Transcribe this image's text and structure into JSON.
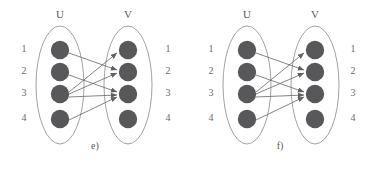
{
  "figure": {
    "background": "#ffffff",
    "node_color": "#58585a",
    "outline_color": "#8e8f91",
    "edge_color": "#6d6e70",
    "text_color": "#58595b",
    "width": 373,
    "height": 171
  },
  "panels": [
    {
      "id": "e",
      "caption": "e)",
      "left_set": {
        "title": "U",
        "nodes": [
          {
            "label": "1",
            "cx": 60,
            "cy": 50
          },
          {
            "label": "2",
            "cx": 60,
            "cy": 72
          },
          {
            "label": "3",
            "cx": 60,
            "cy": 94
          },
          {
            "label": "4",
            "cx": 60,
            "cy": 119
          }
        ]
      },
      "right_set": {
        "title": "V",
        "nodes": [
          {
            "label": "1",
            "cx": 128,
            "cy": 50
          },
          {
            "label": "2",
            "cx": 128,
            "cy": 72
          },
          {
            "label": "3",
            "cx": 128,
            "cy": 94
          },
          {
            "label": "4",
            "cx": 128,
            "cy": 119
          }
        ]
      },
      "edges": [
        {
          "from": 1,
          "to": 2,
          "directed": true
        },
        {
          "from": 2,
          "to": 3,
          "directed": true
        },
        {
          "from": 3,
          "to": 1,
          "directed": true
        },
        {
          "from": 3,
          "to": 2,
          "directed": true
        },
        {
          "from": 3,
          "to": 3,
          "directed": true
        },
        {
          "from": 4,
          "to": 3,
          "directed": true
        }
      ]
    },
    {
      "id": "f",
      "caption": "f)",
      "left_set": {
        "title": "U",
        "nodes": [
          {
            "label": "1",
            "cx": 60,
            "cy": 50
          },
          {
            "label": "2",
            "cx": 60,
            "cy": 72
          },
          {
            "label": "3",
            "cx": 60,
            "cy": 94
          },
          {
            "label": "4",
            "cx": 60,
            "cy": 119
          }
        ]
      },
      "right_set": {
        "title": "V",
        "nodes": [
          {
            "label": "1",
            "cx": 128,
            "cy": 50
          },
          {
            "label": "2",
            "cx": 128,
            "cy": 72
          },
          {
            "label": "3",
            "cx": 128,
            "cy": 94
          },
          {
            "label": "4",
            "cx": 128,
            "cy": 119
          }
        ]
      },
      "edges": [
        {
          "from": 1,
          "to": 2,
          "directed": true
        },
        {
          "from": 2,
          "to": 3,
          "directed": true
        },
        {
          "from": 3,
          "to": 1,
          "directed": true
        },
        {
          "from": 3,
          "to": 2,
          "directed": true
        },
        {
          "from": 3,
          "to": 3,
          "directed": true
        },
        {
          "from": 4,
          "to": 3,
          "directed": true
        }
      ]
    }
  ]
}
